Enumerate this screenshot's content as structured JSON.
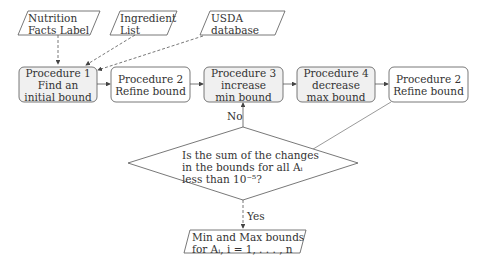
{
  "inputs": [
    {
      "id": "nutrition",
      "lines": [
        "Nutrition",
        "Facts Label"
      ]
    },
    {
      "id": "ingredient",
      "lines": [
        "Ingredient",
        "List"
      ]
    },
    {
      "id": "usda",
      "lines": [
        "USDA",
        "database"
      ]
    }
  ],
  "procedures": [
    {
      "id": "proc1",
      "lines": [
        "Procedure 1",
        "Find an",
        "initial bound"
      ],
      "shaded": true
    },
    {
      "id": "proc2a",
      "lines": [
        "Procedure 2",
        "Refine bound"
      ],
      "shaded": false
    },
    {
      "id": "proc3",
      "lines": [
        "Procedure 3",
        "increase",
        "min bound"
      ],
      "shaded": true
    },
    {
      "id": "proc4",
      "lines": [
        "Procedure 4",
        "decrease",
        "max bound"
      ],
      "shaded": true
    },
    {
      "id": "proc2b",
      "lines": [
        "Procedure 2",
        "Refine bound"
      ],
      "shaded": false
    }
  ],
  "decision": {
    "lines": [
      "Is the sum of the changes",
      "in the bounds for all Aᵢ",
      "less than 10⁻⁵?"
    ]
  },
  "edges": {
    "no_label": "No",
    "yes_label": "Yes"
  },
  "output": {
    "lines": [
      "Min and Max bounds",
      "for Aᵢ, i = 1, . . . , n"
    ]
  },
  "colors": {
    "shaded_fill": "#f0f0f0",
    "stroke": "#555555"
  }
}
